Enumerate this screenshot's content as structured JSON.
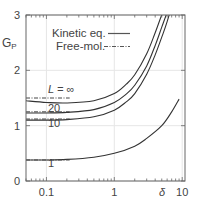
{
  "chart_data": {
    "type": "line",
    "title": "",
    "xlabel": "δ",
    "ylabel": "G_P",
    "xscale": "log",
    "xlim": [
      0.05,
      11
    ],
    "ylim": [
      0,
      3
    ],
    "grid": true,
    "legend_position": "upper-left",
    "x_ticks": [
      {
        "value": 0.1,
        "label": "0.1"
      },
      {
        "value": 1,
        "label": "1"
      },
      {
        "value": 10,
        "label": "10"
      }
    ],
    "y_ticks": [
      {
        "value": 0,
        "label": "0"
      },
      {
        "value": 1,
        "label": "1"
      },
      {
        "value": 2,
        "label": "2"
      },
      {
        "value": 3,
        "label": "3"
      }
    ],
    "legend": [
      {
        "label": "Kinetic eq.",
        "style": "solid"
      },
      {
        "label": "Free-mol.",
        "style": "dash-dot"
      }
    ],
    "series": [
      {
        "name": "L = ∞",
        "label": "L = ∞",
        "free_mol": 1.5,
        "x": [
          0.05,
          0.1,
          0.2,
          0.5,
          1,
          1.5,
          2,
          3,
          4,
          5,
          6,
          7
        ],
        "y": [
          1.45,
          1.42,
          1.41,
          1.45,
          1.58,
          1.75,
          1.92,
          2.3,
          2.68,
          3.0,
          3.2,
          3.4
        ]
      },
      {
        "name": "L = 20",
        "label": "20",
        "free_mol": 1.25,
        "x": [
          0.05,
          0.1,
          0.2,
          0.5,
          1,
          1.5,
          2,
          3,
          4,
          5,
          6,
          7.5
        ],
        "y": [
          1.23,
          1.23,
          1.24,
          1.29,
          1.42,
          1.57,
          1.73,
          2.08,
          2.45,
          2.78,
          3.05,
          3.4
        ]
      },
      {
        "name": "L = 10",
        "label": "10",
        "free_mol": 1.12,
        "x": [
          0.05,
          0.1,
          0.2,
          0.5,
          1,
          1.5,
          2,
          3,
          4,
          5,
          6,
          8
        ],
        "y": [
          1.1,
          1.1,
          1.11,
          1.16,
          1.28,
          1.43,
          1.58,
          1.93,
          2.28,
          2.6,
          2.88,
          3.4
        ]
      },
      {
        "name": "L = 1",
        "label": "1",
        "free_mol": 0.38,
        "x": [
          0.05,
          0.1,
          0.2,
          0.5,
          1,
          2,
          3,
          5,
          7,
          9
        ],
        "y": [
          0.38,
          0.38,
          0.39,
          0.43,
          0.5,
          0.63,
          0.77,
          1.0,
          1.25,
          1.48
        ]
      }
    ]
  }
}
